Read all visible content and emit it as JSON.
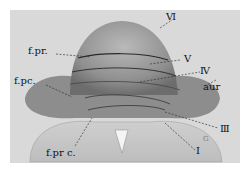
{
  "figure": {
    "type": "anatomical illustration",
    "labels": {
      "VI": "Ⅵ",
      "fpr": "f.pr.",
      "V": "Ⅴ",
      "fpc": "f.pc.",
      "IV": "Ⅳ",
      "aur": "aur",
      "III": "Ⅲ",
      "fprc": "f.pr c.",
      "I": "I",
      "small_mark": "G"
    }
  }
}
